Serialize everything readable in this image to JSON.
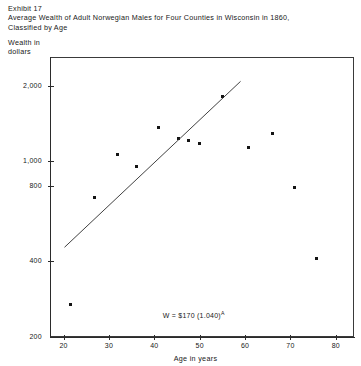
{
  "header": {
    "exhibit": "Exhibit 17",
    "title_line1": "Average Wealth of Adult Norwegian Males for Four Counties in Wisconsin in 1860,",
    "title_line2": "Classified by Age"
  },
  "axis_caption": {
    "line1": "Wealth in",
    "line2": "dollars"
  },
  "chart_data": {
    "type": "scatter",
    "title": "Average Wealth of Adult Norwegian Males for Four Counties in Wisconsin in 1860, Classified by Age",
    "xlabel": "Age in years",
    "ylabel": "Wealth in dollars",
    "xlim": [
      17,
      84
    ],
    "ylim": [
      200,
      2600
    ],
    "yscale": "log",
    "xscale": "linear",
    "grid": false,
    "legend": null,
    "xticks": [
      20,
      30,
      40,
      50,
      60,
      70,
      80
    ],
    "xticklabels": [
      "20",
      "30",
      "40",
      "50",
      "60",
      "70",
      "80"
    ],
    "yticks": [
      200,
      400,
      800,
      1000,
      2000
    ],
    "yticklabels": [
      "200",
      "400",
      "800",
      "1,000",
      "2,000"
    ],
    "series": [
      {
        "name": "Average wealth by age",
        "marker": "square",
        "color": "#141414",
        "points": [
          {
            "x": 21.6,
            "y": 270
          },
          {
            "x": 26.7,
            "y": 720
          },
          {
            "x": 31.8,
            "y": 1060
          },
          {
            "x": 36.0,
            "y": 950
          },
          {
            "x": 40.9,
            "y": 1360
          },
          {
            "x": 45.4,
            "y": 1230
          },
          {
            "x": 47.6,
            "y": 1210
          },
          {
            "x": 50.0,
            "y": 1180
          },
          {
            "x": 55.1,
            "y": 1810
          },
          {
            "x": 60.8,
            "y": 1130
          },
          {
            "x": 66.1,
            "y": 1290
          },
          {
            "x": 70.9,
            "y": 790
          },
          {
            "x": 75.8,
            "y": 410
          }
        ]
      }
    ],
    "fit_line": {
      "equation_text": "W = $170 (1.040)",
      "equation_exponent": "A",
      "intercept": 170,
      "growth_rate": 1.04,
      "x_start": 20.2,
      "y_start": 455,
      "x_end": 59.0,
      "y_end": 2080
    },
    "annotations": [
      {
        "text": "W = $170 (1.040)^A",
        "x": 48,
        "y": 245
      }
    ]
  }
}
